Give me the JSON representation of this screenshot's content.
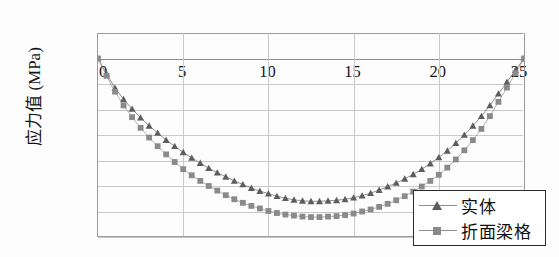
{
  "chart_data": {
    "type": "line",
    "title": "",
    "xlabel": "",
    "ylabel": "应力值 (MPa)",
    "xlim": [
      0,
      25
    ],
    "ylim": [
      -3.5,
      0.5
    ],
    "grid": true,
    "legend_position": "bottom-right",
    "x_ticks": [
      "0",
      "5",
      "10",
      "15",
      "20",
      "25"
    ],
    "x_tick_values": [
      0,
      5,
      10,
      15,
      20,
      25
    ],
    "y_ticks": [
      "0.5",
      "0",
      "-0.5",
      "-1",
      "-1.5",
      "-2",
      "-2.5",
      "-3",
      "-3.5"
    ],
    "y_tick_values": [
      0.5,
      0,
      -0.5,
      -1,
      -1.5,
      -2,
      -2.5,
      -3,
      -3.5
    ],
    "x": [
      0,
      0.5,
      1,
      1.5,
      2,
      2.5,
      3,
      3.5,
      4,
      4.5,
      5,
      5.5,
      6,
      6.5,
      7,
      7.5,
      8,
      8.5,
      9,
      9.5,
      10,
      10.5,
      11,
      11.5,
      12,
      12.5,
      13,
      13.5,
      14,
      14.5,
      15,
      15.5,
      16,
      16.5,
      17,
      17.5,
      18,
      18.5,
      19,
      19.5,
      20,
      20.5,
      21,
      21.5,
      22,
      22.5,
      23,
      23.5,
      24,
      24.5,
      25
    ],
    "series": [
      {
        "name": "实体",
        "marker": "triangle",
        "color": "#5d5d5d",
        "values": [
          0,
          -0.3,
          -0.58,
          -0.8,
          -0.99,
          -1.16,
          -1.32,
          -1.46,
          -1.6,
          -1.72,
          -1.84,
          -1.95,
          -2.05,
          -2.15,
          -2.24,
          -2.32,
          -2.4,
          -2.47,
          -2.54,
          -2.6,
          -2.65,
          -2.7,
          -2.74,
          -2.77,
          -2.79,
          -2.8,
          -2.8,
          -2.79,
          -2.78,
          -2.76,
          -2.73,
          -2.69,
          -2.64,
          -2.58,
          -2.51,
          -2.44,
          -2.36,
          -2.27,
          -2.17,
          -2.06,
          -1.94,
          -1.81,
          -1.66,
          -1.5,
          -1.32,
          -1.13,
          -0.92,
          -0.69,
          -0.46,
          -0.23,
          0
        ]
      },
      {
        "name": "折面梁格",
        "marker": "square",
        "color": "#8a8a8a",
        "values": [
          0,
          -0.34,
          -0.65,
          -0.92,
          -1.15,
          -1.36,
          -1.55,
          -1.72,
          -1.88,
          -2.03,
          -2.17,
          -2.29,
          -2.4,
          -2.5,
          -2.59,
          -2.68,
          -2.76,
          -2.83,
          -2.89,
          -2.94,
          -2.99,
          -3.03,
          -3.06,
          -3.08,
          -3.1,
          -3.11,
          -3.11,
          -3.1,
          -3.09,
          -3.07,
          -3.04,
          -3.0,
          -2.96,
          -2.91,
          -2.85,
          -2.78,
          -2.7,
          -2.61,
          -2.51,
          -2.4,
          -2.28,
          -2.14,
          -1.98,
          -1.8,
          -1.6,
          -1.38,
          -1.13,
          -0.85,
          -0.57,
          -0.29,
          0
        ]
      }
    ],
    "legend_entries": [
      {
        "label": "实体",
        "marker": "triangle"
      },
      {
        "label": "折面梁格",
        "marker": "square"
      }
    ]
  }
}
